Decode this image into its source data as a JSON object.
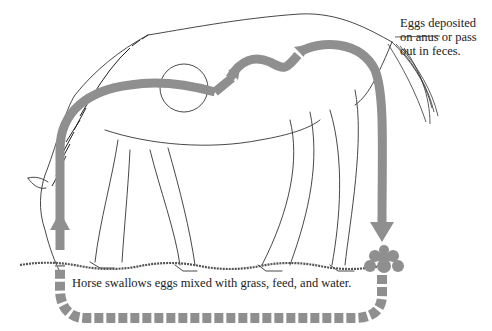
{
  "diagram": {
    "labels": {
      "eggs_deposited_line1": "Eggs deposited",
      "eggs_deposited_line2": "on anus or pass",
      "eggs_deposited_line3": "out in feces.",
      "swallow": "Horse swallows eggs mixed with grass, feed, and water."
    },
    "colors": {
      "arrow": "#8f8f8f",
      "line": "#333333",
      "background": "#ffffff"
    }
  }
}
